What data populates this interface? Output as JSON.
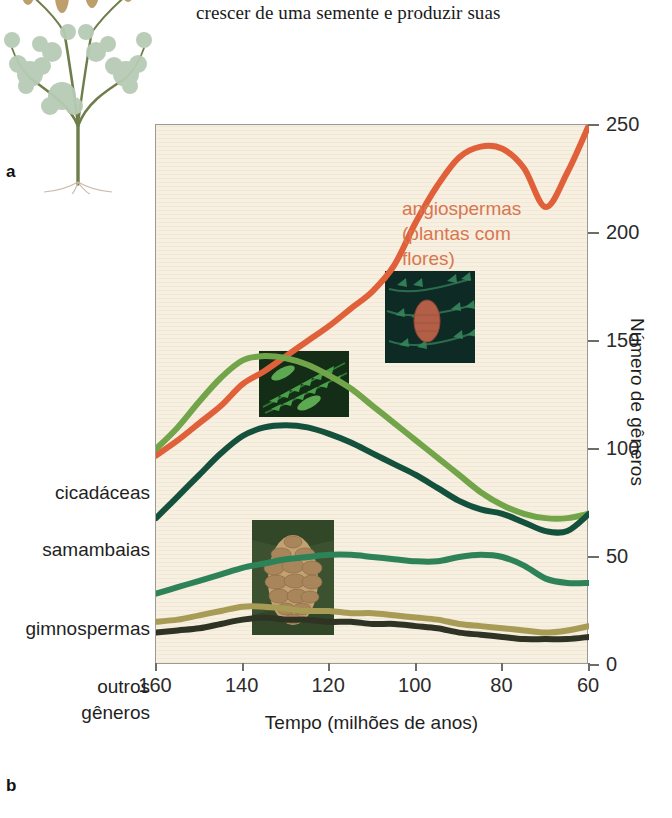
{
  "body_text": "crescer de uma semente e produzir suas",
  "panels": {
    "a_label": "a",
    "b_label": "b",
    "a_figure_name": "plant-illustration"
  },
  "annotation": {
    "line1": "angiospermas",
    "line2": "(plantas com",
    "line3": "flores)",
    "color": "#d9764f"
  },
  "axes": {
    "y_title": "Número de gêneros",
    "x_title": "Tempo (milhões de anos)",
    "y_ticks": [
      "250",
      "200",
      "150",
      "100",
      "50",
      "0"
    ],
    "x_ticks": [
      "160",
      "140",
      "120",
      "100",
      "80",
      "60"
    ]
  },
  "series_labels": [
    {
      "label": "cicadáceas"
    },
    {
      "label": "samambaias"
    },
    {
      "label": "gimnospermas"
    },
    {
      "label": "outros"
    },
    {
      "label": "gêneros"
    }
  ],
  "insets": [
    {
      "name": "conifer-cone-photo",
      "caption": "conifer branch with red cone"
    },
    {
      "name": "fern-frond-photo",
      "caption": "green fern frond"
    },
    {
      "name": "pine-cone-photo",
      "caption": "brown pine cone"
    }
  ],
  "chart_data": {
    "type": "line",
    "title": "",
    "xlabel": "Tempo (milhões de anos)",
    "ylabel": "Número de gêneros",
    "xlim": [
      160,
      60
    ],
    "ylim": [
      0,
      250
    ],
    "x_reversed": true,
    "grid": false,
    "legend": "inline-left-labels",
    "x": [
      160,
      155,
      150,
      145,
      140,
      135,
      130,
      125,
      120,
      115,
      110,
      105,
      100,
      95,
      90,
      85,
      80,
      75,
      70,
      65,
      60
    ],
    "series": [
      {
        "name": "angiospermas (plantas com flores)",
        "color": "#e0603a",
        "values": [
          97,
          104,
          112,
          120,
          130,
          136,
          143,
          150,
          157,
          165,
          173,
          185,
          205,
          222,
          235,
          240,
          239,
          230,
          212,
          228,
          250
        ]
      },
      {
        "name": "cicadáceas",
        "color": "#72a54a",
        "values": [
          100,
          110,
          122,
          133,
          141,
          143,
          142,
          139,
          134,
          128,
          120,
          112,
          104,
          96,
          88,
          80,
          74,
          70,
          68,
          68,
          70
        ]
      },
      {
        "name": "samambaias",
        "color": "#14513c",
        "values": [
          68,
          78,
          88,
          98,
          106,
          110,
          111,
          110,
          107,
          103,
          98,
          93,
          88,
          82,
          76,
          72,
          70,
          66,
          62,
          62,
          70
        ]
      },
      {
        "name": "gimnospermas",
        "color": "#2e8257",
        "values": [
          33,
          36,
          39,
          42,
          45,
          47,
          49,
          50,
          51,
          51,
          50,
          49,
          48,
          48,
          50,
          51,
          50,
          46,
          40,
          38,
          38
        ]
      },
      {
        "name": "outros",
        "color": "#a89b55",
        "values": [
          20,
          21,
          23,
          25,
          27,
          27,
          26,
          25,
          25,
          24,
          24,
          23,
          22,
          21,
          19,
          18,
          17,
          16,
          15,
          16,
          18
        ]
      },
      {
        "name": "gêneros",
        "color": "#2f3324",
        "values": [
          15,
          16,
          17,
          19,
          21,
          22,
          21,
          21,
          20,
          20,
          19,
          19,
          18,
          17,
          15,
          14,
          13,
          12,
          12,
          12,
          13
        ]
      }
    ]
  }
}
